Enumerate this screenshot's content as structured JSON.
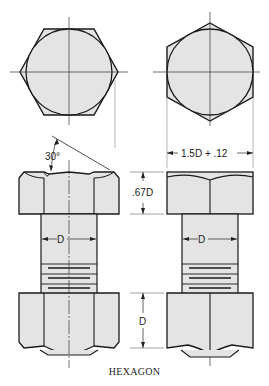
{
  "figure": {
    "caption": "HEXAGON",
    "labels": {
      "chamfer_angle": "30°",
      "across_flats": "1.5D + .12",
      "head_height": ".67D",
      "shank_left": "D",
      "shank_right": "D",
      "nut_height": "D"
    },
    "views": [
      {
        "name": "top-view-across-corners",
        "shape": "hexagon with inscribed circle"
      },
      {
        "name": "top-view-across-flats",
        "shape": "hexagon with inscribed circle"
      },
      {
        "name": "front-view-across-corners",
        "shape": "bolt with hex head and nut"
      },
      {
        "name": "front-view-across-flats",
        "shape": "bolt with hex head and nut"
      }
    ],
    "colors": {
      "fill": "#e4e4e4",
      "stroke": "#1a1a1a",
      "background": "#ffffff"
    }
  }
}
